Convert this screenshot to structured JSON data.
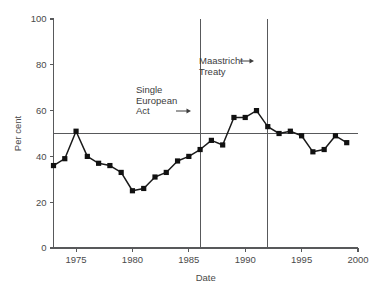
{
  "chart_data": {
    "type": "line",
    "title": "",
    "xlabel": "Date",
    "ylabel": "Per cent",
    "xlim": [
      1973,
      2000
    ],
    "ylim": [
      0,
      100
    ],
    "xticks": [
      1975,
      1980,
      1985,
      1990,
      1995,
      2000
    ],
    "xtick_labels": [
      "1975",
      "1980",
      "1985",
      "1990",
      "1995",
      "2000"
    ],
    "yticks": [
      0,
      20,
      40,
      60,
      80,
      100
    ],
    "ytick_labels": [
      "0",
      "20",
      "40",
      "60",
      "80",
      "100"
    ],
    "grid": false,
    "legend": null,
    "x": [
      1973,
      1974,
      1975,
      1976,
      1977,
      1978,
      1979,
      1980,
      1981,
      1982,
      1983,
      1984,
      1985,
      1986,
      1987,
      1988,
      1989,
      1990,
      1991,
      1992,
      1993,
      1994,
      1995,
      1996,
      1997,
      1998,
      1999
    ],
    "values": [
      36,
      39,
      51,
      40,
      37,
      36,
      33,
      25,
      26,
      31,
      33,
      38,
      40,
      43,
      47,
      45,
      57,
      57,
      60,
      53,
      50,
      51,
      49,
      42,
      43,
      49,
      46
    ],
    "series": [
      {
        "name": "Per cent",
        "values": [
          36,
          39,
          51,
          40,
          37,
          36,
          33,
          25,
          26,
          31,
          33,
          38,
          40,
          43,
          47,
          45,
          57,
          57,
          60,
          53,
          50,
          51,
          49,
          42,
          43,
          49,
          46
        ]
      }
    ],
    "reference_lines": [
      {
        "name": "fifty-per-cent-line",
        "orientation": "horizontal",
        "value": 50
      }
    ],
    "annotations": [
      {
        "name": "single-european-act",
        "label_lines": [
          "Single",
          "European",
          "Act"
        ],
        "arrow": "→",
        "event_year": 1986,
        "orientation": "vertical-event-line"
      },
      {
        "name": "maastricht-treaty",
        "label_lines": [
          "Maastricht",
          "Treaty"
        ],
        "arrow": "→",
        "event_year": 1992,
        "orientation": "vertical-event-line"
      }
    ],
    "colors": {
      "line": "#1a1a1a",
      "marker": "#111111",
      "axis": "#58595b",
      "text": "#4a4a4a",
      "background": "#ffffff"
    }
  }
}
